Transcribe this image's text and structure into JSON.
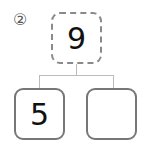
{
  "problem_label": "②",
  "tree": {
    "root": {
      "value": "9",
      "style": "dashed"
    },
    "children": [
      {
        "value": "5"
      },
      {
        "value": ""
      }
    ]
  },
  "colors": {
    "box_border": "#777777",
    "connector": "#bbbbbb"
  }
}
